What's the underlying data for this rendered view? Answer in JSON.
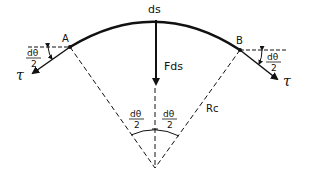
{
  "diagram": {
    "labels": {
      "ds": "ds",
      "point_a": "A",
      "point_b": "B",
      "force": "Fds",
      "radius": "Rc",
      "tension_left": "τ",
      "tension_right": "τ",
      "half_angle_num": "dθ",
      "half_angle_den": "2"
    },
    "colors": {
      "stroke": "#111111",
      "background": "#ffffff"
    },
    "geometry": {
      "point_a": [
        70,
        47
      ],
      "point_b": [
        240,
        50
      ],
      "arc_top": [
        156,
        20
      ],
      "center": [
        155,
        168
      ]
    }
  }
}
